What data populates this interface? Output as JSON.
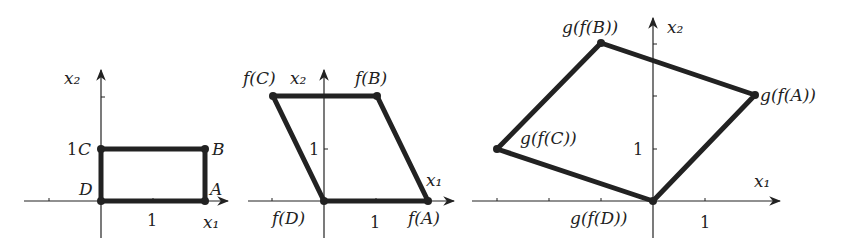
{
  "panels": [
    {
      "name": "original",
      "axis_x_label": "x₁",
      "axis_y_label": "x₂",
      "tick_x": "1",
      "tick_y": "1",
      "points": {
        "A": {
          "label": "A",
          "coord": [
            2,
            0
          ]
        },
        "B": {
          "label": "B",
          "coord": [
            2,
            1
          ]
        },
        "C": {
          "label": "C",
          "coord": [
            0,
            1
          ]
        },
        "D": {
          "label": "D",
          "coord": [
            0,
            0
          ]
        }
      }
    },
    {
      "name": "after-f",
      "axis_x_label": "x₁",
      "axis_y_label": "x₂",
      "tick_x": "1",
      "tick_y": "1",
      "points": {
        "A": {
          "label": "f(A)",
          "coord": [
            2,
            0
          ]
        },
        "B": {
          "label": "f(B)",
          "coord": [
            1,
            2
          ]
        },
        "C": {
          "label": "f(C)",
          "coord": [
            -1,
            2
          ]
        },
        "D": {
          "label": "f(D)",
          "coord": [
            0,
            0
          ]
        }
      }
    },
    {
      "name": "after-g-of-f",
      "axis_x_label": "x₁",
      "axis_y_label": "x₂",
      "tick_x": "1",
      "tick_y": "1",
      "points": {
        "A": {
          "label": "g(f(A))",
          "coord": [
            2,
            2
          ]
        },
        "B": {
          "label": "g(f(B))",
          "coord": [
            -1,
            3
          ]
        },
        "C": {
          "label": "g(f(C))",
          "coord": [
            -3,
            1
          ]
        },
        "D": {
          "label": "g(f(D))",
          "coord": [
            0,
            0
          ]
        }
      }
    }
  ],
  "colors": {
    "stroke": "#222222",
    "background": "#ffffff"
  }
}
